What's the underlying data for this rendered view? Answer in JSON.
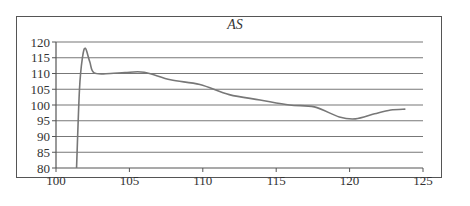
{
  "chart_data": {
    "type": "line",
    "title": "AS",
    "xlabel": "",
    "ylabel": "",
    "xlim": [
      100,
      125
    ],
    "ylim": [
      80,
      120
    ],
    "x_ticks": [
      100,
      105,
      110,
      115,
      120,
      125
    ],
    "y_ticks": [
      80,
      85,
      90,
      95,
      100,
      105,
      110,
      115,
      120
    ],
    "grid": "horizontal",
    "legend": null,
    "series": [
      {
        "name": "AS",
        "color": "#777777",
        "x": [
          101.4,
          101.6,
          101.8,
          102.0,
          102.3,
          102.6,
          103.7,
          104.7,
          106.0,
          107.8,
          109.8,
          111.8,
          113.9,
          115.9,
          117.6,
          119.3,
          120.4,
          121.7,
          122.8,
          123.8
        ],
        "y": [
          80,
          105,
          115,
          118,
          113.7,
          110.2,
          110.0,
          110.3,
          110.4,
          108.0,
          106.5,
          103.3,
          101.6,
          100.0,
          99.4,
          96.2,
          95.6,
          97.2,
          98.4,
          98.7
        ]
      }
    ]
  },
  "labels": {
    "title": "AS",
    "x": [
      "100",
      "105",
      "110",
      "115",
      "120",
      "125"
    ],
    "y": [
      "120",
      "115",
      "110",
      "105",
      "100",
      "95",
      "90",
      "85",
      "80"
    ]
  }
}
